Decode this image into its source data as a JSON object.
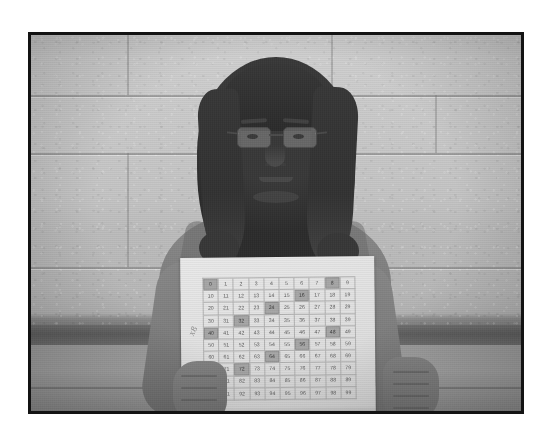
{
  "photo": {
    "description": "Black and white photograph of a student holding a printed hundreds chart",
    "border_color": "#131313",
    "background_color": "#ffffff"
  },
  "scene": {
    "wall": {
      "name": "cinder block wall",
      "upper_color": "#c8c8c8",
      "band_color": "#5d5d5d",
      "lower_color": "#9d9d9d"
    },
    "subject": {
      "name": "student",
      "hair": "long dark hair",
      "eyewear": "glasses",
      "clothing": "sleeveless top",
      "skin_tone_color": "#8a857f",
      "hair_color": "#3a3734"
    }
  },
  "chart_paper": {
    "handwriting": "x8",
    "paper_color": "#e7e5e0",
    "grid_line_color": "#b4b1ac",
    "highlight_color": "#a9a6a1"
  },
  "chart_data": {
    "type": "table",
    "rows": 10,
    "columns": 10,
    "values": [
      [
        0,
        1,
        2,
        3,
        4,
        5,
        6,
        7,
        8,
        9
      ],
      [
        10,
        11,
        12,
        13,
        14,
        15,
        16,
        17,
        18,
        19
      ],
      [
        20,
        21,
        22,
        23,
        24,
        25,
        26,
        27,
        28,
        29
      ],
      [
        30,
        31,
        32,
        33,
        34,
        35,
        36,
        37,
        38,
        39
      ],
      [
        40,
        41,
        42,
        43,
        44,
        45,
        46,
        47,
        48,
        49
      ],
      [
        50,
        51,
        52,
        53,
        54,
        55,
        56,
        57,
        58,
        59
      ],
      [
        60,
        61,
        62,
        63,
        64,
        65,
        66,
        67,
        68,
        69
      ],
      [
        70,
        71,
        72,
        73,
        74,
        75,
        76,
        77,
        78,
        79
      ],
      [
        80,
        81,
        82,
        83,
        84,
        85,
        86,
        87,
        88,
        89
      ],
      [
        90,
        91,
        92,
        93,
        94,
        95,
        96,
        97,
        98,
        99
      ]
    ],
    "highlighted": [
      0,
      8,
      16,
      24,
      32,
      40,
      48,
      56,
      64,
      72,
      80
    ],
    "pattern": "multiples of 8",
    "annotation": "x8"
  }
}
